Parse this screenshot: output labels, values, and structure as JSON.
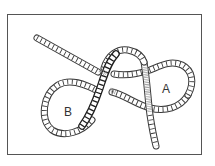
{
  "figure": {
    "labels": {
      "loop_a": "A",
      "loop_b": "B"
    },
    "colors": {
      "frame": "#555555",
      "rope_outline": "#333333",
      "rope_fill": "#ffffff",
      "rope_shade": "#999999"
    }
  }
}
